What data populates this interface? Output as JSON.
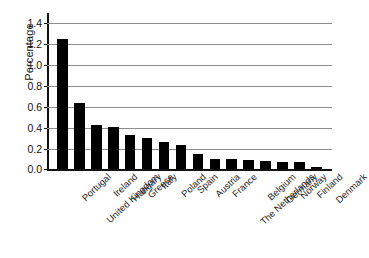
{
  "chart_data": {
    "type": "bar",
    "title": "",
    "subtitle": "",
    "xlabel": "",
    "ylabel": "Percentage",
    "categories": [
      "Portugal",
      "United Kingdom",
      "Ireland",
      "Hungary",
      "Greece",
      "Italy",
      "Poland",
      "Spain",
      "Austria",
      "France",
      "The Netherlands",
      "Belgium",
      "Germany",
      "Norway",
      "Finland",
      "Denmark"
    ],
    "values": [
      1.25,
      0.64,
      0.43,
      0.41,
      0.33,
      0.3,
      0.26,
      0.23,
      0.15,
      0.1,
      0.1,
      0.09,
      0.08,
      0.07,
      0.07,
      0.02
    ],
    "ylim": [
      0.0,
      1.5
    ],
    "yticks": [
      0.0,
      0.2,
      0.4,
      0.6,
      0.8,
      1.0,
      1.2,
      1.4
    ],
    "ytick_labels": [
      "0.0",
      "0.2",
      "0.4",
      "0.6",
      "0.8",
      "1.0",
      "1.2",
      "1.4"
    ],
    "grid": true,
    "grid_axis": "y",
    "legend": false,
    "legend_position": "none",
    "bar_color": "#000000",
    "grid_color": "#8d8d8d",
    "axis_color": "#111111",
    "background_color": "#ffffff",
    "xtick_rotation": -43
  }
}
